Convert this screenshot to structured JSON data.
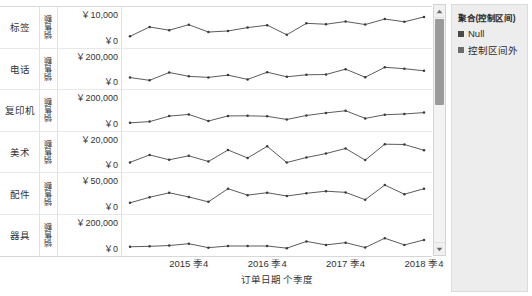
{
  "axis": {
    "x_title": "订单日期 个季度",
    "x_ticks": [
      "2015 季4",
      "2016 季4",
      "2017 季4",
      "2018 季4"
    ],
    "measure_label": "销售额",
    "zero_label": "￥0"
  },
  "legend": {
    "title": "聚合(控制区间)",
    "items": [
      {
        "label": "Null",
        "color": "#4a4a4a"
      },
      {
        "label": "控制区间外",
        "color": "#6b6b6b"
      }
    ]
  },
  "scrollbar": {
    "up_icon": "chevron-up-icon",
    "down_icon": "chevron-down-icon"
  },
  "chart_data": {
    "type": "line",
    "title": "",
    "xlabel": "订单日期 个季度",
    "ylabel": "销售额",
    "grid": false,
    "legend_position": "right",
    "x_tick_labels": [
      "2015 季4",
      "2016 季4",
      "2017 季4",
      "2018 季4"
    ],
    "x_quarters": [
      "2015 季1",
      "2015 季2",
      "2015 季3",
      "2015 季4",
      "2016 季1",
      "2016 季2",
      "2016 季3",
      "2016 季4",
      "2017 季1",
      "2017 季2",
      "2017 季3",
      "2017 季4",
      "2018 季1",
      "2018 季2",
      "2018 季3",
      "2018 季4"
    ],
    "panels": [
      {
        "category": "标签",
        "measure": "销售额",
        "ymax_label": "￥10,000",
        "ymin_label": "￥0",
        "ylim": [
          0,
          10000
        ],
        "values": [
          2050,
          5100,
          4050,
          5850,
          3450,
          3800,
          4900,
          5700,
          2550,
          6300,
          6000,
          6900,
          5900,
          7700,
          6800,
          8400
        ]
      },
      {
        "category": "电话",
        "measure": "销售额",
        "ymax_label": "￥200,000",
        "ymin_label": "￥0",
        "ylim": [
          0,
          200000
        ],
        "values": [
          46000,
          28000,
          79000,
          54000,
          47000,
          62000,
          34000,
          81000,
          51000,
          64000,
          66000,
          101000,
          48000,
          113000,
          104000,
          90000
        ]
      },
      {
        "category": "复印机",
        "measure": "销售额",
        "ymax_label": "￥200,000",
        "ymin_label": "￥0",
        "ylim": [
          0,
          200000
        ],
        "values": [
          18000,
          26000,
          62000,
          73000,
          30000,
          63000,
          64000,
          61000,
          40000,
          66000,
          83000,
          97000,
          47000,
          71000,
          76000,
          85000
        ]
      },
      {
        "category": "美术",
        "measure": "销售额",
        "ymax_label": "￥20,000",
        "ymin_label": "￥0",
        "ylim": [
          0,
          20000
        ],
        "values": [
          3400,
          8300,
          5100,
          7700,
          4000,
          11500,
          6300,
          13900,
          3300,
          6600,
          9200,
          12500,
          4900,
          15300,
          15100,
          11300
        ]
      },
      {
        "category": "配件",
        "measure": "销售额",
        "ymax_label": "￥50,000",
        "ymin_label": "￥0",
        "ylim": [
          0,
          50000
        ],
        "values": [
          9500,
          18500,
          25800,
          19000,
          11000,
          32500,
          22000,
          26000,
          20500,
          25000,
          28500,
          26500,
          14500,
          38500,
          23500,
          32500
        ]
      },
      {
        "category": "器具",
        "measure": "销售额",
        "ymax_label": "￥200,000",
        "ymin_label": "￥0",
        "ylim": [
          0,
          200000
        ],
        "values": [
          25000,
          28000,
          33000,
          45000,
          19000,
          30000,
          30000,
          30000,
          16000,
          60000,
          37000,
          52000,
          20000,
          81000,
          37000,
          70000
        ]
      }
    ]
  }
}
